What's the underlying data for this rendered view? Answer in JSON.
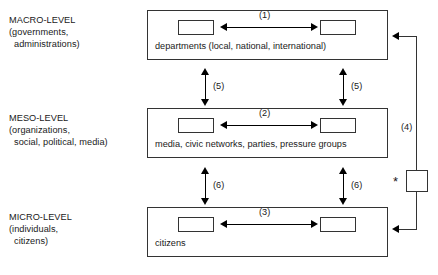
{
  "figure": {
    "levels": [
      {
        "id": "macro",
        "title": "MACRO-LEVEL",
        "sub1": "(governments,",
        "sub2": "administrations)",
        "box_caption": "departments (local, national, international)",
        "horizontal_connector": "(1)"
      },
      {
        "id": "meso",
        "title": "MESO-LEVEL",
        "sub1": "(organizations,",
        "sub2": "social, political, media)",
        "box_caption": "media, civic networks, parties, pressure groups",
        "horizontal_connector": "(2)"
      },
      {
        "id": "micro",
        "title": "MICRO-LEVEL",
        "sub1": "(individuals,",
        "sub2": "citizens)",
        "box_caption": "citizens",
        "horizontal_connector": "(3)"
      }
    ],
    "vertical_connectors": {
      "macro_meso_left": "(5)",
      "macro_meso_right": "(5)",
      "meso_micro_left": "(6)",
      "meso_micro_right": "(6)"
    },
    "feedback_loop": {
      "label": "(4)",
      "marker": "*"
    },
    "clipped_caption": "",
    "colors": {
      "stroke": "#333333",
      "text": "#1a1a1a",
      "background": "#ffffff"
    }
  }
}
